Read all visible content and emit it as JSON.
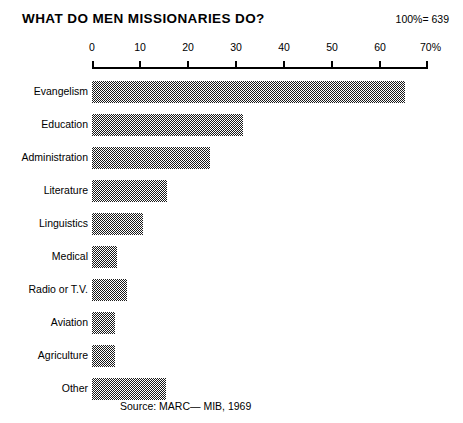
{
  "header": {
    "title": "WHAT DO MEN MISSIONARIES DO?",
    "sample_size": "100%= 639"
  },
  "footer": {
    "source": "Source: MARC— MIB, 1969"
  },
  "chart_data": {
    "type": "bar",
    "orientation": "horizontal",
    "title": "WHAT DO MEN MISSIONARIES DO?",
    "subtitle": "",
    "xlabel": "",
    "ylabel": "",
    "xlim": [
      0,
      70
    ],
    "grid": false,
    "legend": null,
    "annotations": [
      "100%= 639",
      "Source: MARC— MIB, 1969"
    ],
    "total_n": 639,
    "units": "percent",
    "xticks": [
      0,
      10,
      20,
      30,
      40,
      50,
      60,
      70
    ],
    "xticklabels": [
      "0",
      "10",
      "20",
      "30",
      "40",
      "50",
      "60",
      "70%"
    ],
    "categories": [
      "Evangelism",
      "Education",
      "Administration",
      "Literature",
      "Linguistics",
      "Medical",
      "Radio or T.V.",
      "Aviation",
      "Agriculture",
      "Other"
    ],
    "values": [
      65.2,
      31.5,
      24.6,
      15.6,
      10.6,
      5.2,
      7.3,
      4.8,
      4.8,
      15.4
    ],
    "bar_color": "#4d4d4d",
    "bar_fill": "checkerboard-dither-50"
  }
}
